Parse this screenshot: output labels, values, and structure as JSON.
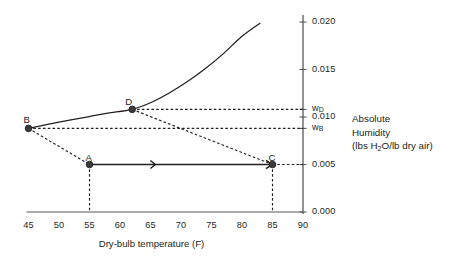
{
  "chart_data": {
    "type": "line",
    "title": "",
    "xlabel": "Dry-bulb temperature (F)",
    "ylabel": "Absolute Humidity (lbs H2O/lb dry air)",
    "xlim": [
      45,
      90
    ],
    "ylim": [
      0.0,
      0.02
    ],
    "grid": false,
    "legend": null,
    "xticks": [
      "45",
      "50",
      "55",
      "60",
      "65",
      "70",
      "75",
      "80",
      "85",
      "90"
    ],
    "xtick_values": [
      45,
      50,
      55,
      60,
      65,
      70,
      75,
      80,
      85,
      90
    ],
    "yticks": [
      "0.000",
      "0.005",
      "0.010",
      "0.015",
      "0.020"
    ],
    "ytick_values": [
      0.0,
      0.005,
      0.01,
      0.015,
      0.02
    ],
    "special_yticks": [
      {
        "label": "w_D",
        "sub": "D",
        "value": 0.0108
      },
      {
        "label": "w_B",
        "sub": "B",
        "value": 0.0088
      }
    ],
    "series": [
      {
        "name": "saturation-curve",
        "style": "solid",
        "points": [
          {
            "x": 45,
            "y": 0.0088
          },
          {
            "x": 50,
            "y": 0.00945
          },
          {
            "x": 55,
            "y": 0.01005
          },
          {
            "x": 58,
            "y": 0.0104
          },
          {
            "x": 62,
            "y": 0.0108
          },
          {
            "x": 65,
            "y": 0.0115
          },
          {
            "x": 68,
            "y": 0.0125
          },
          {
            "x": 71,
            "y": 0.0137
          },
          {
            "x": 74,
            "y": 0.0151
          },
          {
            "x": 77,
            "y": 0.0167
          },
          {
            "x": 80,
            "y": 0.0185
          },
          {
            "x": 83,
            "y": 0.0199
          }
        ]
      },
      {
        "name": "process-A-to-C",
        "style": "solid-arrow",
        "points": [
          {
            "x": 55,
            "y": 0.005
          },
          {
            "x": 85,
            "y": 0.005
          }
        ]
      },
      {
        "name": "mixing-line-B-to-A",
        "style": "dashed",
        "points": [
          {
            "x": 45,
            "y": 0.0088
          },
          {
            "x": 55,
            "y": 0.005
          }
        ]
      },
      {
        "name": "mixing-line-D-to-C",
        "style": "dashed",
        "points": [
          {
            "x": 62,
            "y": 0.0108
          },
          {
            "x": 85,
            "y": 0.005
          }
        ]
      }
    ],
    "guide_lines": [
      {
        "name": "wB-horizontal",
        "style": "dashed",
        "from": {
          "x": 45,
          "y": 0.0088
        },
        "to": {
          "x": 90,
          "y": 0.0088
        }
      },
      {
        "name": "wD-horizontal",
        "style": "dashed",
        "from": {
          "x": 62,
          "y": 0.0108
        },
        "to": {
          "x": 90,
          "y": 0.0108
        }
      },
      {
        "name": "C-horizontal",
        "style": "dashed",
        "from": {
          "x": 85,
          "y": 0.005
        },
        "to": {
          "x": 90,
          "y": 0.005
        }
      },
      {
        "name": "A-vertical",
        "style": "dashed",
        "from": {
          "x": 55,
          "y": 0.005
        },
        "to": {
          "x": 55,
          "y": 0.0
        }
      },
      {
        "name": "C-vertical",
        "style": "dashed",
        "from": {
          "x": 85,
          "y": 0.005
        },
        "to": {
          "x": 85,
          "y": 0.0
        }
      }
    ],
    "points": [
      {
        "label": "A",
        "x": 55,
        "y": 0.005,
        "label_dx": -1,
        "label_dy": -13
      },
      {
        "label": "B",
        "x": 45,
        "y": 0.0088,
        "label_dx": -2,
        "label_dy": -14
      },
      {
        "label": "C",
        "x": 85,
        "y": 0.005,
        "label_dx": -1,
        "label_dy": -13
      },
      {
        "label": "D",
        "x": 62,
        "y": 0.0108,
        "label_dx": -4,
        "label_dy": -13
      }
    ]
  },
  "annotations": {
    "y_axis_caption_line1": "Absolute",
    "y_axis_caption_line2": "Humidity",
    "y_axis_caption_line3_pre": "(lbs H",
    "y_axis_caption_line3_sub": "2",
    "y_axis_caption_line3_post": "O/lb dry air)"
  },
  "colors": {
    "ink": "#231f20",
    "axis": "#58595b",
    "background": "#ffffff"
  }
}
